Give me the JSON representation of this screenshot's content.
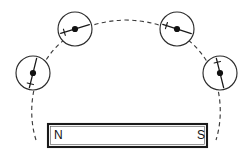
{
  "figure": {
    "canvas": {
      "width": 251,
      "height": 159,
      "background": "#ffffff"
    },
    "colors": {
      "ink": "#1a1a1a",
      "magnet_outline": "#1a1a1a",
      "field_line": "#3b3b3b",
      "compass_outline": "#2b2b2b",
      "needle": "#111111",
      "paper": "#ffffff"
    }
  },
  "magnet": {
    "name": "bar-magnet",
    "x": 48,
    "y": 124,
    "width": 159,
    "height": 23,
    "north_label": "N",
    "south_label": "S",
    "north_label_x": 54,
    "south_label_x": 197,
    "label_y": 136
  },
  "field_line": {
    "name": "magnetic-field-line",
    "style": "dashed",
    "path": "M 36 140 C 22 96, 40 22, 126 20 C 212 22, 230 96, 216 140",
    "dash": "4.2 3.4"
  },
  "compasses": [
    {
      "id": "compass-1",
      "position_label": "left-lower",
      "cx": 33,
      "cy": 73,
      "r": 17,
      "needle_angle_deg": 104,
      "needle_length": 15,
      "tick_end": "north"
    },
    {
      "id": "compass-2",
      "position_label": "left-upper",
      "cx": 75,
      "cy": 29,
      "r": 17,
      "needle_angle_deg": 163,
      "needle_length": 15,
      "tick_end": "north"
    },
    {
      "id": "compass-3",
      "position_label": "right-upper",
      "cx": 177,
      "cy": 29,
      "r": 17,
      "needle_angle_deg": 198,
      "needle_length": 15,
      "tick_end": "north"
    },
    {
      "id": "compass-4",
      "position_label": "right-lower",
      "cx": 220,
      "cy": 73,
      "r": 17,
      "needle_angle_deg": 256,
      "needle_length": 15,
      "tick_end": "north"
    }
  ]
}
